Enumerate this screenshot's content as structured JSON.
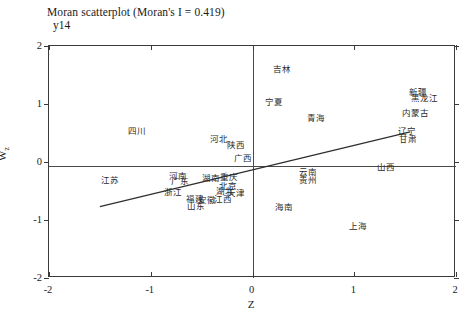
{
  "chart_data": {
    "type": "scatter",
    "title": "Moran scatterplot (Moran's I = 0.419)",
    "series_label": "y14",
    "xlabel": "Z",
    "ylabel": "Wz",
    "xlim": [
      -2,
      2
    ],
    "ylim": [
      -2,
      2
    ],
    "grid": false,
    "legend": "none",
    "morans_i": 0.419,
    "xticks": [
      "-2",
      "-1",
      "0",
      "1",
      "2"
    ],
    "xtick_values": [
      -2,
      -1,
      0,
      1,
      2
    ],
    "yticks": [
      "-2",
      "-1",
      "0",
      "1",
      "2"
    ],
    "ytick_values": [
      -2,
      -1,
      0,
      1,
      2
    ],
    "mean_lines": {
      "x": 0,
      "y": -0.07
    },
    "fit_line": {
      "x0": -1.5,
      "y0": -0.77,
      "x1": 1.55,
      "y1": 0.52
    },
    "points": [
      {
        "label": "吉林",
        "x": 0.3,
        "y": 1.58
      },
      {
        "label": "新疆",
        "x": 1.64,
        "y": 1.19
      },
      {
        "label": "黑龙江",
        "x": 1.7,
        "y": 1.08
      },
      {
        "label": "宁夏",
        "x": 0.22,
        "y": 1.02
      },
      {
        "label": "内蒙古",
        "x": 1.61,
        "y": 0.82
      },
      {
        "label": "青海",
        "x": 0.63,
        "y": 0.75
      },
      {
        "label": "辽宁",
        "x": 1.53,
        "y": 0.51
      },
      {
        "label": "甘肃",
        "x": 1.54,
        "y": 0.38
      },
      {
        "label": "四川",
        "x": -1.13,
        "y": 0.52
      },
      {
        "label": "河北",
        "x": -0.32,
        "y": 0.38
      },
      {
        "label": "陕西",
        "x": -0.15,
        "y": 0.28
      },
      {
        "label": "广西",
        "x": -0.08,
        "y": 0.05
      },
      {
        "label": "山西",
        "x": 1.32,
        "y": -0.1
      },
      {
        "label": "云南",
        "x": 0.56,
        "y": -0.19
      },
      {
        "label": "贵州",
        "x": 0.56,
        "y": -0.32
      },
      {
        "label": "江苏",
        "x": -1.39,
        "y": -0.33
      },
      {
        "label": "河南",
        "x": -0.72,
        "y": -0.25
      },
      {
        "label": "广东",
        "x": -0.7,
        "y": -0.35
      },
      {
        "label": "湖南",
        "x": -0.4,
        "y": -0.29
      },
      {
        "label": "重庆",
        "x": -0.22,
        "y": -0.27
      },
      {
        "label": "北京",
        "x": -0.23,
        "y": -0.43
      },
      {
        "label": "浙江",
        "x": -0.77,
        "y": -0.53
      },
      {
        "label": "湖北",
        "x": -0.26,
        "y": -0.52
      },
      {
        "label": "天津",
        "x": -0.15,
        "y": -0.56
      },
      {
        "label": "福建",
        "x": -0.56,
        "y": -0.65
      },
      {
        "label": "安徽",
        "x": -0.44,
        "y": -0.68
      },
      {
        "label": "江西",
        "x": -0.28,
        "y": -0.66
      },
      {
        "label": "山东",
        "x": -0.55,
        "y": -0.78
      },
      {
        "label": "海南",
        "x": 0.32,
        "y": -0.8
      },
      {
        "label": "上海",
        "x": 1.05,
        "y": -1.12
      }
    ]
  }
}
